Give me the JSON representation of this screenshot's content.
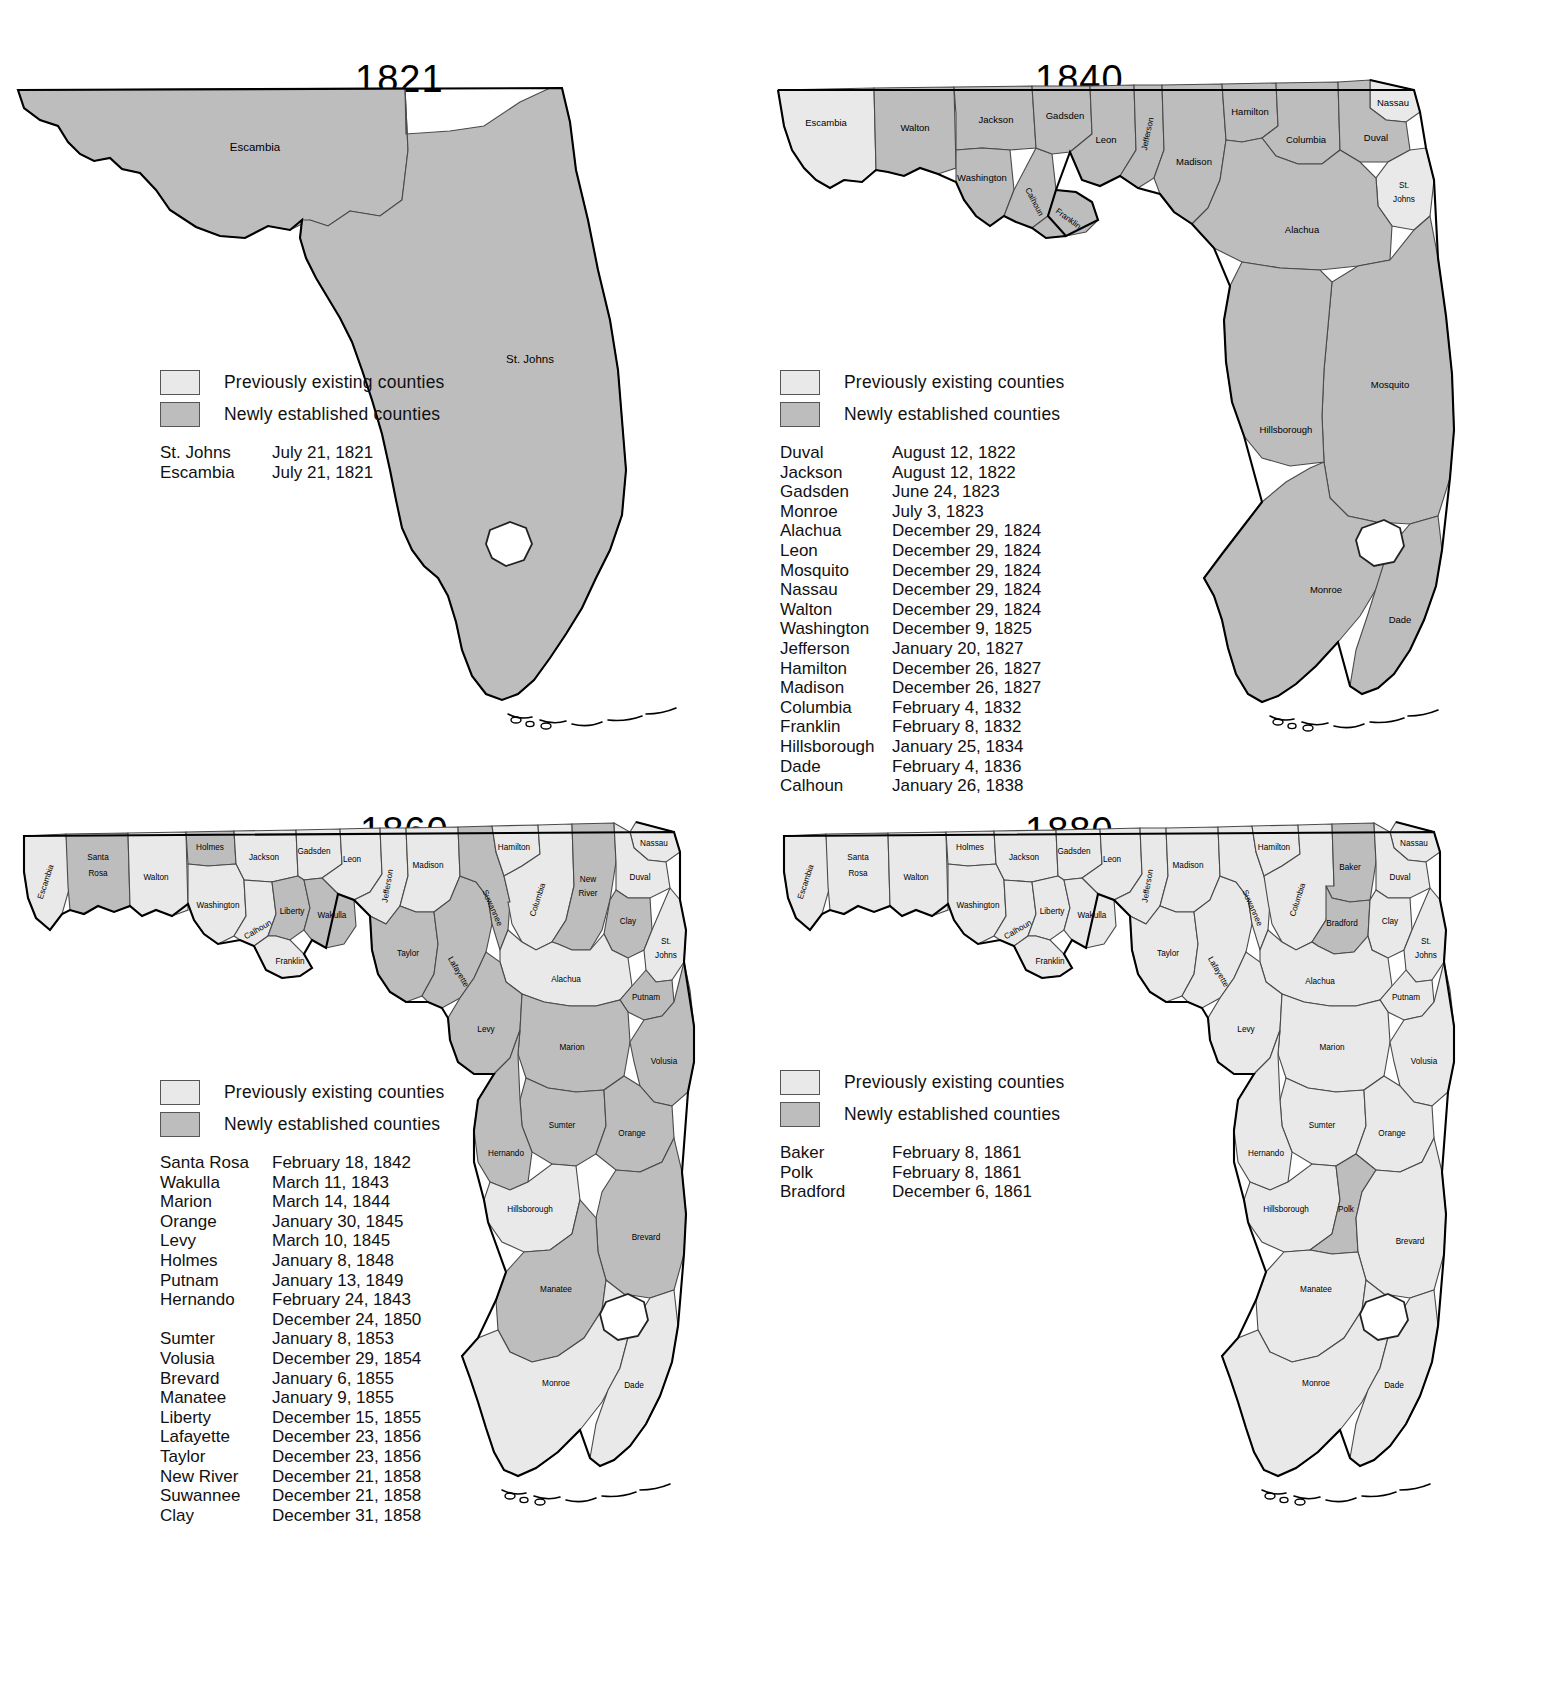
{
  "legend": {
    "previously_existing": "Previously existing counties",
    "newly_established": "Newly established counties",
    "color_previous": "#e9e9e9",
    "color_new": "#bdbdbd"
  },
  "panels": [
    {
      "year": "1821",
      "map_labels": [
        "Escambia",
        "St. Johns"
      ],
      "new_counties": [
        "Escambia",
        "St. Johns"
      ],
      "existing_counties": [],
      "list": [
        {
          "name": "St. Johns",
          "date": "July 21, 1821"
        },
        {
          "name": "Escambia",
          "date": "July 21, 1821"
        }
      ]
    },
    {
      "year": "1840",
      "map_labels": [
        "Escambia",
        "Walton",
        "Jackson",
        "Washington",
        "Gadsden",
        "Calhoun",
        "Franklin",
        "Leon",
        "Jefferson",
        "Madison",
        "Hamilton",
        "Columbia",
        "Nassau",
        "Duval",
        "St. Johns",
        "Alachua",
        "Mosquito",
        "Hillsborough",
        "Monroe",
        "Dade"
      ],
      "existing_counties": [
        "Escambia",
        "St. Johns"
      ],
      "list": [
        {
          "name": "Duval",
          "date": "August 12, 1822"
        },
        {
          "name": "Jackson",
          "date": "August 12, 1822"
        },
        {
          "name": "Gadsden",
          "date": "June 24, 1823"
        },
        {
          "name": "Monroe",
          "date": "July 3, 1823"
        },
        {
          "name": "Alachua",
          "date": "December 29, 1824"
        },
        {
          "name": "Leon",
          "date": "December 29, 1824"
        },
        {
          "name": "Mosquito",
          "date": "December 29, 1824"
        },
        {
          "name": "Nassau",
          "date": "December 29, 1824"
        },
        {
          "name": "Walton",
          "date": "December 29, 1824"
        },
        {
          "name": "Washington",
          "date": "December 9, 1825"
        },
        {
          "name": "Jefferson",
          "date": "January 20, 1827"
        },
        {
          "name": "Hamilton",
          "date": "December 26, 1827"
        },
        {
          "name": "Madison",
          "date": "December 26, 1827"
        },
        {
          "name": "Columbia",
          "date": "February 4, 1832"
        },
        {
          "name": "Franklin",
          "date": "February 8, 1832"
        },
        {
          "name": "Hillsborough",
          "date": "January 25, 1834"
        },
        {
          "name": "Dade",
          "date": "February 4, 1836"
        },
        {
          "name": "Calhoun",
          "date": "January 26, 1838"
        }
      ]
    },
    {
      "year": "1860",
      "map_labels": [
        "Escambia",
        "Santa Rosa",
        "Walton",
        "Holmes",
        "Jackson",
        "Washington",
        "Gadsden",
        "Leon",
        "Liberty",
        "Wakulla",
        "Calhoun",
        "Franklin",
        "Jefferson",
        "Madison",
        "Taylor",
        "Lafayette",
        "Suwannee",
        "Hamilton",
        "Columbia",
        "New River",
        "Nassau",
        "Duval",
        "Clay",
        "St. Johns",
        "Alachua",
        "Putnam",
        "Levy",
        "Marion",
        "Volusia",
        "Sumter",
        "Orange",
        "Hernando",
        "Hillsborough",
        "Brevard",
        "Manatee",
        "Monroe",
        "Dade"
      ],
      "list": [
        {
          "name": "Santa Rosa",
          "date": "February 18, 1842"
        },
        {
          "name": "Wakulla",
          "date": "March 11, 1843"
        },
        {
          "name": "Marion",
          "date": "March 14, 1844"
        },
        {
          "name": "Orange",
          "date": "January 30, 1845"
        },
        {
          "name": "Levy",
          "date": "March 10, 1845"
        },
        {
          "name": "Holmes",
          "date": "January 8, 1848"
        },
        {
          "name": "Putnam",
          "date": "January 13, 1849"
        },
        {
          "name": "Hernando",
          "date": "February 24, 1843"
        },
        {
          "name": "",
          "date": "December 24, 1850"
        },
        {
          "name": "Sumter",
          "date": "January 8, 1853"
        },
        {
          "name": "Volusia",
          "date": "December 29, 1854"
        },
        {
          "name": "Brevard",
          "date": "January 6, 1855"
        },
        {
          "name": "Manatee",
          "date": "January 9, 1855"
        },
        {
          "name": "Liberty",
          "date": "December 15, 1855"
        },
        {
          "name": "Lafayette",
          "date": "December 23, 1856"
        },
        {
          "name": "Taylor",
          "date": "December 23, 1856"
        },
        {
          "name": "New River",
          "date": "December 21, 1858"
        },
        {
          "name": "Suwannee",
          "date": "December 21, 1858"
        },
        {
          "name": "Clay",
          "date": "December 31, 1858"
        }
      ]
    },
    {
      "year": "1880",
      "map_labels": [
        "Escambia",
        "Santa Rosa",
        "Walton",
        "Holmes",
        "Jackson",
        "Washington",
        "Gadsden",
        "Leon",
        "Liberty",
        "Wakulla",
        "Calhoun",
        "Franklin",
        "Jefferson",
        "Madison",
        "Taylor",
        "Lafayette",
        "Suwannee",
        "Hamilton",
        "Columbia",
        "Baker",
        "Bradford",
        "Nassau",
        "Duval",
        "Clay",
        "St. Johns",
        "Alachua",
        "Putnam",
        "Levy",
        "Marion",
        "Volusia",
        "Sumter",
        "Orange",
        "Hernando",
        "Hillsborough",
        "Polk",
        "Brevard",
        "Manatee",
        "Monroe",
        "Dade"
      ],
      "new_counties": [
        "Baker",
        "Bradford",
        "Polk"
      ],
      "list": [
        {
          "name": "Baker",
          "date": "February 8, 1861"
        },
        {
          "name": "Polk",
          "date": "February 8, 1861"
        },
        {
          "name": "Bradford",
          "date": "December 6, 1861"
        }
      ]
    }
  ]
}
